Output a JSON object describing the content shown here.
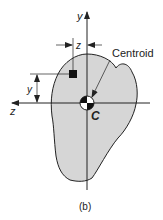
{
  "figure": {
    "caption": "(b)",
    "axes": {
      "vertical_label": "y",
      "horizontal_label": "z"
    },
    "centroid_label": "Centroid",
    "centroid_point_label": "C",
    "dimensions": {
      "vertical_offset_label": "y",
      "horizontal_offset_label": "z"
    },
    "colors": {
      "shape_fill": "#d6d6d6",
      "stroke": "#222222",
      "element": "#111111"
    }
  }
}
